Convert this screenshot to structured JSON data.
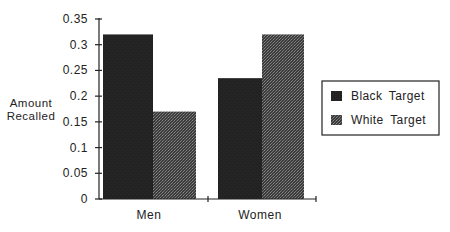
{
  "chart_data": {
    "type": "bar",
    "title": "",
    "xlabel": "",
    "ylabel": "Amount Recalled",
    "ylabel_lines": [
      "Amount",
      "Recalled"
    ],
    "categories": [
      "Men",
      "Women"
    ],
    "series": [
      {
        "name": "Black Target",
        "values": [
          0.32,
          0.235
        ],
        "color": "#222222",
        "pattern": "solid"
      },
      {
        "name": "White Target",
        "values": [
          0.17,
          0.32
        ],
        "color": "#4a4a4a",
        "pattern": "stipple"
      }
    ],
    "ylim": [
      0,
      0.35
    ],
    "yticks": [
      0,
      0.05,
      0.1,
      0.15,
      0.2,
      0.25,
      0.3,
      0.35
    ],
    "ytick_labels": [
      "0",
      "0.05",
      "0.1",
      "0.15",
      "0.2",
      "0.25",
      "0.3",
      "0.35"
    ],
    "grid": false,
    "legend_position": "right"
  }
}
